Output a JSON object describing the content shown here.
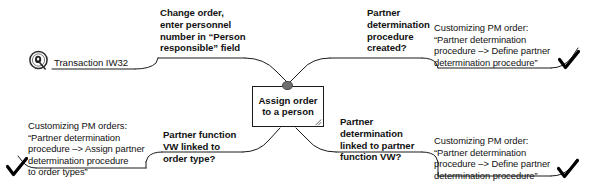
{
  "diagram": {
    "type": "mind-map",
    "center": {
      "text": "Assign order\nto a person"
    },
    "source": {
      "icon": "seal-stamp-icon",
      "label": "Transaction IW32"
    },
    "branches": [
      {
        "id": "change-order",
        "position": "top-left",
        "emphasis": "bold",
        "text": "Change order,\nenter personnel\nnumber in “Person\nresponsible” field"
      },
      {
        "id": "procedure-created",
        "position": "top-center-right",
        "emphasis": "bold",
        "text": "Partner\ndetermination\nprocedure\ncreated?"
      },
      {
        "id": "define-partner-procedure-top",
        "position": "top-right",
        "emphasis": "plain",
        "text": "Customizing PM order:\n“Partner determination\nprocedure –> Define partner\ndetermination procedure”",
        "marker": "checkmark"
      },
      {
        "id": "assign-order-types",
        "position": "bottom-left",
        "emphasis": "plain",
        "text": "Customizing PM orders:\n“Partner determination\nprocedure –> Assign partner\ndetermination procedure\nto order types”",
        "marker": "checkmark"
      },
      {
        "id": "partner-function-vw",
        "position": "bottom-center-left",
        "emphasis": "bold",
        "text": "Partner function\nVW linked to\norder type?"
      },
      {
        "id": "linked-partner-function",
        "position": "bottom-center-right",
        "emphasis": "bold",
        "text": "Partner\ndetermination\nlinked to partner\nfunction VW?"
      },
      {
        "id": "define-partner-procedure-bottom",
        "position": "bottom-right",
        "emphasis": "plain",
        "text": "Customizing PM order:\n“Partner determination\nprocedure –> Define partner\ndetermination procedure”",
        "marker": "checkmark"
      }
    ],
    "colors": {
      "line": "#1a1a1a",
      "node_fill": "#6e6e6e",
      "background": "#ffffff",
      "text": "#111111"
    }
  }
}
